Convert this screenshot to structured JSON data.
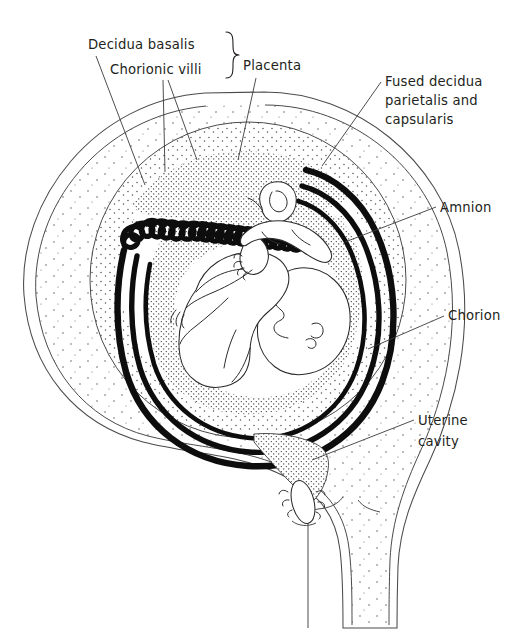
{
  "figure": {
    "background_color": "#ffffff",
    "ink_color": "#231f20",
    "membrane_color": "#0d0d0d",
    "leader_color": "#3b3b3b"
  },
  "labels": [
    {
      "id": "decidua-basalis",
      "text": "Decidua basalis",
      "x": 88,
      "y": 49,
      "anchor": "start"
    },
    {
      "id": "chorionic-villi",
      "text": "Chorionic villi",
      "x": 110,
      "y": 74,
      "anchor": "start"
    },
    {
      "id": "placenta",
      "text": "Placenta",
      "x": 243,
      "y": 70,
      "anchor": "start"
    },
    {
      "id": "fused-decidua-line1",
      "text": "Fused decidua",
      "x": 385,
      "y": 86,
      "anchor": "start"
    },
    {
      "id": "fused-decidua-line2",
      "text": "parietalis and",
      "x": 385,
      "y": 105,
      "anchor": "start"
    },
    {
      "id": "fused-decidua-line3",
      "text": "capsularis",
      "x": 385,
      "y": 124,
      "anchor": "start"
    },
    {
      "id": "amnion",
      "text": "Amnion",
      "x": 440,
      "y": 212,
      "anchor": "start"
    },
    {
      "id": "chorion",
      "text": "Chorion",
      "x": 448,
      "y": 320,
      "anchor": "start"
    },
    {
      "id": "uterine-cavity-line1",
      "text": "Uterine",
      "x": 418,
      "y": 425,
      "anchor": "start"
    },
    {
      "id": "uterine-cavity-line2",
      "text": "cavity",
      "x": 418,
      "y": 446,
      "anchor": "start"
    }
  ],
  "structures": [
    {
      "id": "uterine-wall-outer",
      "name": "Uterine wall (myometrium), outer contour"
    },
    {
      "id": "uterine-wall-inner",
      "name": "Myometrium inner contour"
    },
    {
      "id": "decidua-parietalis",
      "name": "Fused decidua parietalis and capsularis"
    },
    {
      "id": "decidua-basalis",
      "name": "Decidua basalis (placental bed)"
    },
    {
      "id": "chorionic-villi",
      "name": "Chorionic villi"
    },
    {
      "id": "chorion-membrane",
      "name": "Chorion"
    },
    {
      "id": "amnion-membrane",
      "name": "Amnion"
    },
    {
      "id": "amniotic-cavity",
      "name": "Amniotic cavity"
    },
    {
      "id": "fetus",
      "name": "Fetus in vertex presentation"
    },
    {
      "id": "umbilical-cord",
      "name": "Umbilical cord"
    },
    {
      "id": "uterine-cavity",
      "name": "Uterine cavity (lower segment)"
    },
    {
      "id": "cervical-canal",
      "name": "Cervical canal with mucus plug"
    },
    {
      "id": "vagina",
      "name": "Vagina"
    }
  ]
}
